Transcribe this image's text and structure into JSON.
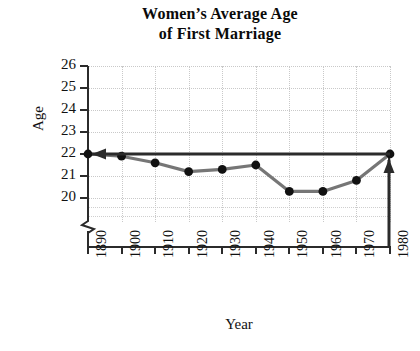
{
  "chart_data": {
    "type": "line",
    "title_lines": [
      "Women’s Average Age",
      "of First Marriage"
    ],
    "xlabel": "Year",
    "ylabel": "Age",
    "categories": [
      1890,
      1900,
      1910,
      1920,
      1930,
      1940,
      1950,
      1960,
      1970,
      1980
    ],
    "x_tick_labels": [
      "1890",
      "1900",
      "1910",
      "1920",
      "1930",
      "1940",
      "1950",
      "1960",
      "1970",
      "1980"
    ],
    "values": [
      22.0,
      21.9,
      21.6,
      21.2,
      21.3,
      21.5,
      20.3,
      20.3,
      20.8,
      22.0
    ],
    "y_tick_labels": [
      "26",
      "25",
      "24",
      "23",
      "22",
      "21",
      "20"
    ],
    "y_ticks": [
      26,
      25,
      24,
      23,
      22,
      21,
      20
    ],
    "ylim": [
      19.5,
      26
    ],
    "xlim": [
      1890,
      1980
    ],
    "grid": true,
    "grid_style": "dotted",
    "legend": null,
    "axis_break": true,
    "annotations": [
      {
        "name": "reference-line-22",
        "type": "horizontal-line-with-left-arrow",
        "y_value": 22.0,
        "from_x": 1980,
        "to_x": 1890,
        "color": "#2b2b2b"
      },
      {
        "name": "reference-line-1980",
        "type": "vertical-line-with-up-arrow",
        "x_value": 1980,
        "from_y": 19.5,
        "to_y": 22.0,
        "color": "#2b2b2b"
      }
    ],
    "series_color": "#767676",
    "marker_color": "#111111",
    "marker_shape": "circle",
    "gridline_color": "#c9c9c9",
    "axis_color": "#2b2b2b",
    "background_color": "#ffffff"
  }
}
